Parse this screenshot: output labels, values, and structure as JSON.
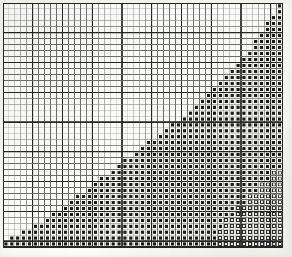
{
  "document": {
    "kind": "counted cross-stitch chart",
    "title": "Stepped Diagonal Filled Chart",
    "caption": "Scanned graph-paper chart with filled and open square symbols"
  },
  "chart_data": {
    "type": "heatmap",
    "title": "Stepped Diagonal Filled Chart",
    "subtitle": "",
    "xlabel": "",
    "ylabel": "",
    "grid": true,
    "legend_position": "none",
    "columns": 47,
    "rows": 41,
    "cell_px": 5.95,
    "heavy_line_every": 5,
    "xlim": [
      0,
      47
    ],
    "ylim": [
      0,
      41
    ],
    "categories": [
      "empty",
      "filled",
      "open"
    ],
    "legend": [
      {
        "key": "empty",
        "label": "blank cell",
        "color": "#fdfdfb"
      },
      {
        "key": "filled",
        "label": "filled square symbol",
        "color": "#1a1a1a"
      },
      {
        "key": "open",
        "label": "open square symbol",
        "color": "#f6f6f3"
      }
    ],
    "colors": {
      "background": "#fdfdfb",
      "grid_light": "#6e6e6e",
      "grid_heavy": "#262626",
      "symbol_filled": "#1a1a1a",
      "symbol_filled_ring": "#fafaf7",
      "symbol_open_border": "#2b2b2b",
      "symbol_open_fill": "#f7f7f4",
      "paper": "#fbfbf8"
    },
    "geometry": {
      "origin_x": 3,
      "origin_y": 3,
      "width_px": 280,
      "height_px": 245
    },
    "filled_start_col_by_row": [
      46,
      46,
      45,
      44,
      44,
      43,
      42,
      42,
      41,
      40,
      39,
      38,
      37,
      36,
      35,
      34,
      33,
      32,
      31,
      30,
      28,
      27,
      26,
      24,
      23,
      22,
      20,
      19,
      18,
      16,
      15,
      14,
      12,
      11,
      10,
      8,
      7,
      5,
      3,
      1,
      0
    ],
    "open_start_col_by_row": [
      47,
      47,
      47,
      47,
      47,
      47,
      47,
      47,
      47,
      47,
      47,
      47,
      47,
      47,
      47,
      47,
      47,
      47,
      47,
      47,
      47,
      47,
      47,
      47,
      47,
      47,
      47,
      47,
      45,
      45,
      43,
      43,
      41,
      41,
      39,
      39,
      37,
      37,
      36,
      36,
      36
    ]
  }
}
